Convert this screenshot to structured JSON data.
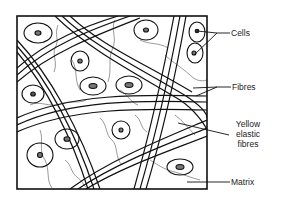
{
  "diagram": {
    "labels": {
      "cells": "Cells",
      "fibres": "Fibres",
      "yellow_elastic_fibres_line1": "Yellow",
      "yellow_elastic_fibres_line2": "elastic",
      "yellow_elastic_fibres_line3": "fibres",
      "matrix": "Matrix"
    },
    "components": [
      "cells",
      "collagen fibres (bundles)",
      "yellow elastic fibres (thin wavy)",
      "matrix"
    ],
    "colors": {
      "line": "#111111",
      "thin_line": "#555555",
      "background": "#ffffff",
      "nucleus": "#777777"
    }
  }
}
